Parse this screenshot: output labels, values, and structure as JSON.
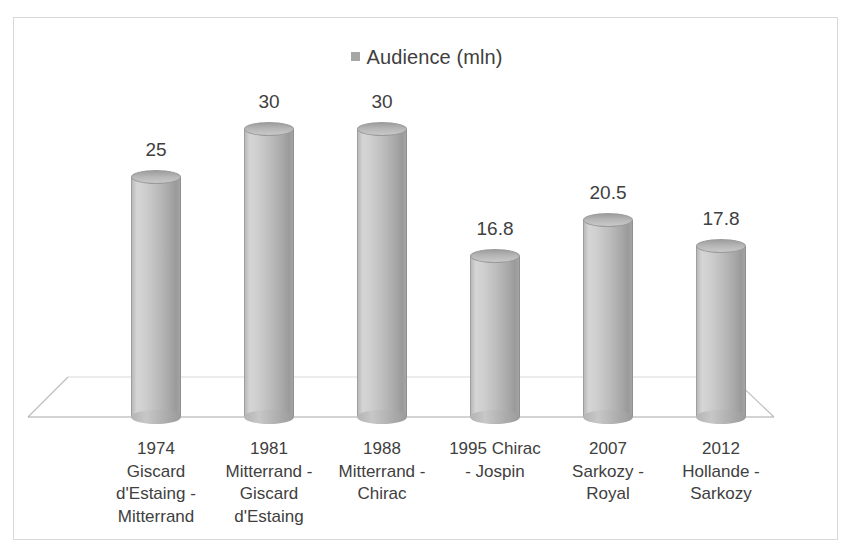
{
  "chart_data": {
    "type": "bar",
    "title": "",
    "subtitle": "",
    "xlabel": "",
    "ylabel": "",
    "ylim": [
      0,
      30
    ],
    "grid": false,
    "legend_position": "top-center",
    "style": "3d-cylinder",
    "series": [
      {
        "name": "Audience (mln)",
        "values": [
          25,
          30,
          30,
          16.8,
          20.5,
          17.8
        ]
      }
    ],
    "categories": [
      "1974 Giscard d'Estaing - Mitterrand",
      "1981 Mitterrand - Giscard d'Estaing",
      "1988 Mitterrand - Chirac",
      "1995 Chirac - Jospin",
      "2007 Sarkozy - Royal",
      "2012 Hollande - Sarkozy"
    ],
    "category_lines": [
      [
        "1974",
        "Giscard",
        "d'Estaing -",
        "Mitterrand"
      ],
      [
        "1981",
        "Mitterrand -",
        "Giscard",
        "d'Estaing"
      ],
      [
        "1988",
        "Mitterrand -",
        "Chirac"
      ],
      [
        "1995 Chirac",
        "- Jospin"
      ],
      [
        "2007",
        "Sarkozy -",
        "Royal"
      ],
      [
        "2012",
        "Hollande -",
        "Sarkozy"
      ]
    ],
    "data_labels": [
      "25",
      "30",
      "30",
      "16.8",
      "20.5",
      "17.8"
    ]
  },
  "legend": {
    "label": "Audience (mln)",
    "swatch_color": "#a6a6a6"
  },
  "colors": {
    "bar_fill": "#bdbdbd",
    "bar_edge": "#9a9a9a",
    "frame_border": "#d8d8d8",
    "background": "#ffffff",
    "text": "#404040",
    "floor_line": "#bfbfbf"
  }
}
